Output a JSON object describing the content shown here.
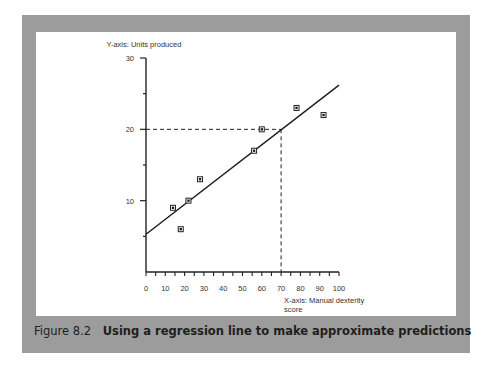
{
  "figure": {
    "number": "Figure 8.2",
    "title": "Using a regression line to make approximate predictions"
  },
  "chart_data": {
    "type": "scatter",
    "title": "",
    "xlabel": "X-axis: Manual dexterity score",
    "xlabel_lines": [
      "X-axis: Manual dexterity",
      "score"
    ],
    "ylabel": "Y-axis: Units produced",
    "xlim": [
      0,
      100
    ],
    "ylim": [
      0,
      30
    ],
    "x_ticks": [
      0,
      10,
      20,
      30,
      40,
      50,
      60,
      70,
      80,
      90,
      100
    ],
    "y_ticks": [
      10,
      20,
      30
    ],
    "y_minor_ticks": [
      5,
      15,
      25
    ],
    "x_minor_step": 5,
    "grid": false,
    "legend": null,
    "series": [
      {
        "name": "Observations",
        "marker": "square",
        "points": [
          {
            "x": 14,
            "y": 9
          },
          {
            "x": 18,
            "y": 6
          },
          {
            "x": 22,
            "y": 10
          },
          {
            "x": 28,
            "y": 13
          },
          {
            "x": 56,
            "y": 17
          },
          {
            "x": 60,
            "y": 20
          },
          {
            "x": 78,
            "y": 23
          },
          {
            "x": 92,
            "y": 22
          }
        ]
      }
    ],
    "regression_line": {
      "x": [
        0,
        100
      ],
      "y": [
        5.3,
        26.2
      ]
    },
    "annotations": [
      {
        "type": "dashed_guide",
        "from": {
          "x": 0,
          "y": 20
        },
        "to": {
          "x": 70,
          "y": 20
        }
      },
      {
        "type": "dashed_guide",
        "from": {
          "x": 70,
          "y": 20
        },
        "to": {
          "x": 70,
          "y": 0
        }
      }
    ]
  }
}
